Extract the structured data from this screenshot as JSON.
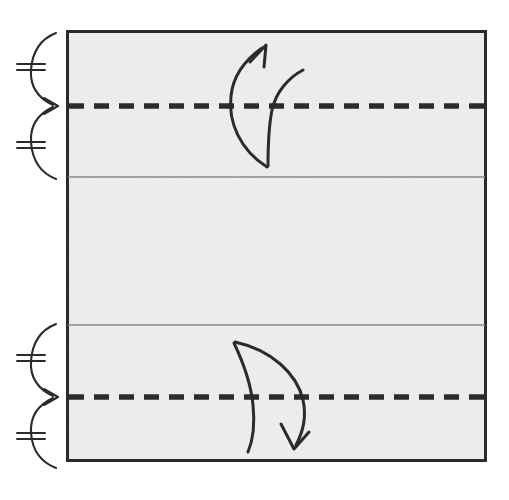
{
  "figure": {
    "kind": "origami-fold-diagram",
    "canvas": {
      "width": 509,
      "height": 500
    },
    "background_color": "#ffffff",
    "paper": {
      "name": "paper-sheet",
      "fill_color": "#eeeeee",
      "border_color": "#2b2b2b",
      "border_width": 3,
      "x": 66,
      "y": 30,
      "width": 421,
      "height": 432
    },
    "crease_lines": [
      {
        "name": "valley-fold-top",
        "style": "dashed",
        "color": "#2b2b2b",
        "width": 5,
        "dash": "14 10",
        "y": 106,
        "label": "valley fold"
      },
      {
        "name": "existing-crease-top",
        "style": "solid",
        "color": "#8a8a8a",
        "width": 1,
        "y": 177,
        "label": "existing crease"
      },
      {
        "name": "existing-crease-bottom",
        "style": "solid",
        "color": "#8a8a8a",
        "width": 1,
        "y": 325,
        "label": "existing crease"
      },
      {
        "name": "valley-fold-bottom",
        "style": "dashed",
        "color": "#2b2b2b",
        "width": 5,
        "dash": "14 10",
        "y": 397,
        "label": "valley fold"
      }
    ],
    "braces": [
      {
        "name": "measure-brace-top",
        "orientation": "right-pointing",
        "color": "#2b2b2b",
        "top_y": 32,
        "point_y": 106,
        "bottom_y": 180,
        "tip_x": 60,
        "spine_x": 30,
        "tick_count": 2,
        "tick_mark": "double-hatch",
        "meaning": "equal distances"
      },
      {
        "name": "measure-brace-bottom",
        "orientation": "right-pointing",
        "color": "#2b2b2b",
        "top_y": 323,
        "point_y": 397,
        "bottom_y": 464,
        "tip_x": 60,
        "spine_x": 30,
        "tick_count": 2,
        "tick_mark": "double-hatch",
        "meaning": "equal distances"
      }
    ],
    "arrows": [
      {
        "name": "fold-unfold-arrow-top",
        "direction": "up",
        "color": "#2b2b2b",
        "width": 3,
        "arrowhead": "open-barb",
        "meaning": "fold and unfold"
      },
      {
        "name": "fold-unfold-arrow-bottom",
        "direction": "down",
        "color": "#2b2b2b",
        "width": 3,
        "arrowhead": "open-barb",
        "meaning": "fold and unfold"
      }
    ],
    "caption": ""
  }
}
